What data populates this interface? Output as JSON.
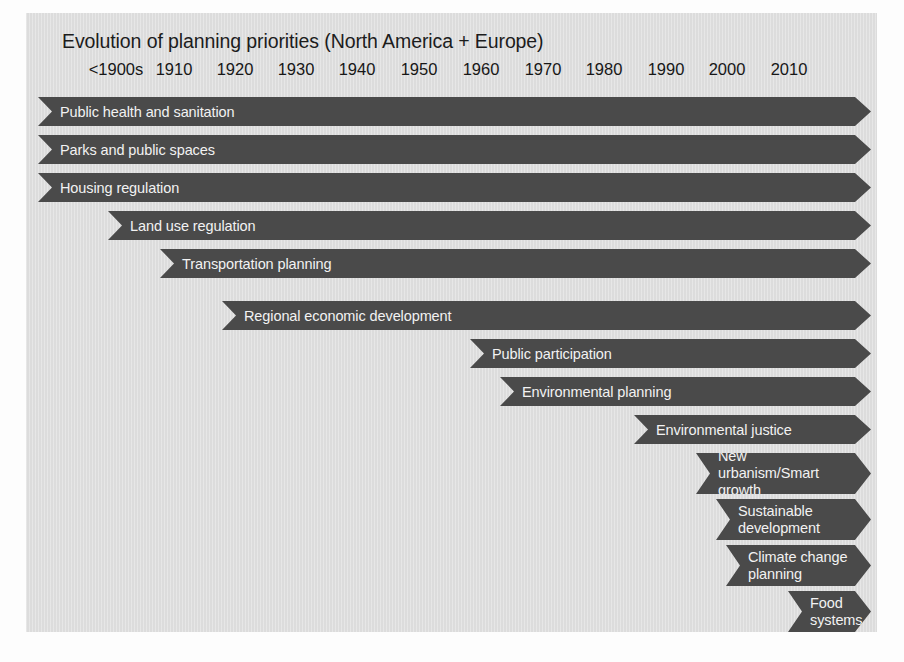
{
  "chart_data": {
    "type": "bar",
    "subtype": "timeline-gantt-arrows",
    "title": "Evolution of planning priorities (North America + Europe)",
    "xlabel": "",
    "ylabel": "",
    "grid": false,
    "legend": "none",
    "axis_ticks": [
      "<1900s",
      "1910",
      "1920",
      "1930",
      "1940",
      "1950",
      "1960",
      "1970",
      "1980",
      "1990",
      "2000",
      "2010"
    ],
    "axis_tick_positions_px": [
      90,
      148,
      209,
      270,
      331,
      393,
      455,
      517,
      578,
      640,
      701,
      763
    ],
    "x_axis_note": "Each tick is a decade; bars begin at the decade the priority emerged and continue to the present (arrowhead = ongoing).",
    "categories": [
      "Public health and sanitation",
      "Parks and public spaces",
      "Housing regulation",
      "Land use regulation",
      "Transportation planning",
      "Regional economic development",
      "Public participation",
      "Environmental planning",
      "Environmental justice",
      "New urbanism/Smart growth",
      "Sustainable development",
      "Climate change planning",
      "Food systems"
    ],
    "bars": [
      {
        "label": "Public health and sanitation",
        "start_year": "<1900s",
        "end_year": "2010s",
        "lines": 1
      },
      {
        "label": "Parks and public spaces",
        "start_year": "<1900s",
        "end_year": "2010s",
        "lines": 1
      },
      {
        "label": "Housing regulation",
        "start_year": "<1900s",
        "end_year": "2010s",
        "lines": 1
      },
      {
        "label": "Land use regulation",
        "start_year": "1910",
        "end_year": "2010s",
        "lines": 1
      },
      {
        "label": "Transportation planning",
        "start_year": "1920",
        "end_year": "2010s",
        "lines": 1
      },
      {
        "label": "Regional economic development",
        "start_year": "1930",
        "end_year": "2010s",
        "lines": 1
      },
      {
        "label": "Public participation",
        "start_year": "1960",
        "end_year": "2010s",
        "lines": 1
      },
      {
        "label": "Environmental planning",
        "start_year": "1965",
        "end_year": "2010s",
        "lines": 1
      },
      {
        "label": "Environmental justice",
        "start_year": "1980",
        "end_year": "2010s",
        "lines": 1
      },
      {
        "label": "New urbanism/Smart\ngrowth",
        "start_year": "1990",
        "end_year": "2010s",
        "lines": 2
      },
      {
        "label": "Sustainable\ndevelopment",
        "start_year": "1993",
        "end_year": "2010s",
        "lines": 2
      },
      {
        "label": "Climate change\nplanning",
        "start_year": "2000",
        "end_year": "2010s",
        "lines": 2
      },
      {
        "label": "Food\nsystems",
        "start_year": "2008",
        "end_year": "2010s",
        "lines": 2
      }
    ],
    "colors": {
      "bar_fill": "#4a4a4a",
      "bar_text": "#f2f2f2",
      "panel_background": "#dcdcdc",
      "title_text": "#1c1c1c",
      "axis_text": "#171717",
      "page_background": "#fdfdfd"
    },
    "geometry": {
      "bar_left_px": [
        12,
        12,
        12,
        82,
        134,
        196,
        444,
        474,
        608,
        670,
        690,
        700,
        762
      ],
      "bar_right_px": [
        845,
        845,
        845,
        845,
        845,
        845,
        845,
        845,
        845,
        845,
        845,
        845,
        845
      ],
      "bar_top_px": [
        84,
        122,
        160,
        198,
        236,
        288,
        326,
        364,
        402,
        440,
        486,
        532,
        578
      ],
      "bar_height_px": [
        29,
        29,
        29,
        29,
        29,
        29,
        29,
        29,
        29,
        41,
        41,
        41,
        41
      ]
    }
  }
}
